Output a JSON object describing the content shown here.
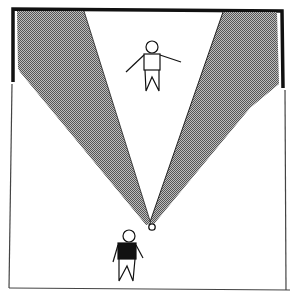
{
  "diagram": {
    "type": "field-of-view illustration",
    "room": {
      "outline_color": "#3a3a3a",
      "wall_thick_color": "#111111",
      "background": "#ffffff"
    },
    "view_cones": {
      "fill_color": "#8f8f8f",
      "edge_color": "#222222",
      "count": 2
    },
    "figures": [
      {
        "id": "observed-person",
        "role": "person standing in room, arms outstretched",
        "body_fill": "#ffffff"
      },
      {
        "id": "viewer",
        "role": "viewer with dark shirt",
        "body_fill": "#111111"
      }
    ],
    "eye_point": {
      "label": "viewpoint",
      "shape": "small circle"
    }
  }
}
